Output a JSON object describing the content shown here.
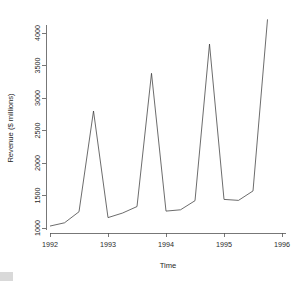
{
  "chart_data": {
    "type": "line",
    "title": "",
    "xlabel": "Time",
    "ylabel": "Revenue ($ millions)",
    "xlim": [
      1992.0,
      1996.0
    ],
    "ylim": [
      1000,
      4250
    ],
    "xticks": [
      1992,
      1993,
      1994,
      1995,
      1996
    ],
    "xtick_labels": [
      "1992",
      "1993",
      "1994",
      "1995",
      "1996"
    ],
    "yticks": [
      1000,
      1500,
      2000,
      2500,
      3000,
      3500,
      4000
    ],
    "ytick_labels": [
      "1000",
      "1500",
      "2000",
      "2500",
      "3000",
      "3500",
      "4000"
    ],
    "grid": false,
    "legend": null,
    "line_color": "#3b3b3b",
    "series": [
      {
        "name": "Revenue",
        "x": [
          1992.0,
          1992.25,
          1992.5,
          1992.75,
          1993.0,
          1993.25,
          1993.5,
          1993.75,
          1994.0,
          1994.25,
          1994.5,
          1994.75,
          1995.0,
          1995.25,
          1995.5,
          1995.75
        ],
        "values": [
          1030,
          1080,
          1250,
          2800,
          1160,
          1230,
          1330,
          3380,
          1260,
          1280,
          1420,
          3830,
          1440,
          1425,
          1570,
          4210
        ]
      }
    ]
  },
  "figure": {
    "plot_left_px": 46,
    "plot_right_px": 290,
    "plot_top_px": 22,
    "plot_bottom_px": 233
  }
}
